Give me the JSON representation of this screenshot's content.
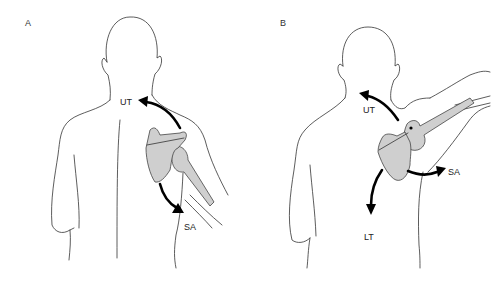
{
  "panels": [
    {
      "id": "A",
      "label": "A",
      "arrows": [
        {
          "label": "UT",
          "meaning": "upper trapezius"
        },
        {
          "label": "SA",
          "meaning": "serratus anterior"
        }
      ]
    },
    {
      "id": "B",
      "label": "B",
      "arrows": [
        {
          "label": "UT",
          "meaning": "upper trapezius"
        },
        {
          "label": "SA",
          "meaning": "serratus anterior"
        },
        {
          "label": "LT",
          "meaning": "lower trapezius"
        }
      ]
    }
  ]
}
